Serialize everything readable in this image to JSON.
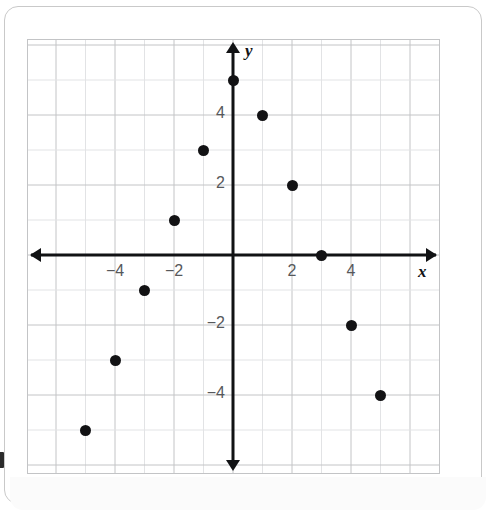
{
  "chart_data": {
    "type": "scatter",
    "title": "",
    "xlabel": "x",
    "ylabel": "y",
    "xlim": [
      -7,
      7
    ],
    "ylim": [
      -7,
      6
    ],
    "grid": true,
    "legend": null,
    "x_ticks": [
      -4,
      -2,
      2,
      4
    ],
    "y_ticks": [
      4,
      2,
      -2,
      -4
    ],
    "x_tick_labels": [
      "−4",
      "−2",
      "2",
      "4"
    ],
    "y_tick_labels": [
      "4",
      "2",
      "−2",
      "−4"
    ],
    "points": [
      {
        "x": -5,
        "y": -5
      },
      {
        "x": -4,
        "y": -3
      },
      {
        "x": -3,
        "y": -1
      },
      {
        "x": -2,
        "y": 1
      },
      {
        "x": -1,
        "y": 3
      },
      {
        "x": 0,
        "y": 5
      },
      {
        "x": 1,
        "y": 4
      },
      {
        "x": 2,
        "y": 2
      },
      {
        "x": 3,
        "y": 0
      },
      {
        "x": 4,
        "y": -2
      },
      {
        "x": 5,
        "y": -4
      }
    ],
    "colors": {
      "point": "#121214",
      "axis": "#111214",
      "grid_major": "#c3c4c6",
      "grid_minor": "#e2e3e5",
      "tick_text": "#56585b"
    }
  },
  "axis_names": {
    "x": "x",
    "y": "y"
  },
  "edge_marker": {
    "label": ""
  }
}
